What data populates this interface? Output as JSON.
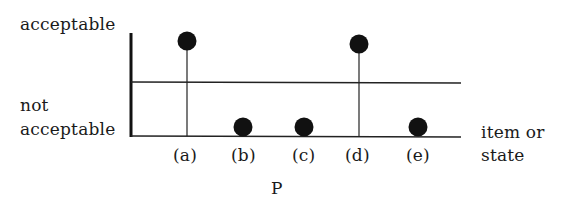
{
  "diagram": {
    "y_labels": {
      "top": "acceptable",
      "bottom_line1": "not",
      "bottom_line2": "acceptable"
    },
    "x_axis_label_line1": "item or",
    "x_axis_label_line2": "state",
    "caption": "P",
    "items": [
      {
        "label": "(a)",
        "state": "acceptable"
      },
      {
        "label": "(b)",
        "state": "not acceptable"
      },
      {
        "label": "(c)",
        "state": "not acceptable"
      },
      {
        "label": "(d)",
        "state": "acceptable"
      },
      {
        "label": "(e)",
        "state": "not acceptable"
      }
    ],
    "colors": {
      "ink": "#111111",
      "background": "#ffffff"
    }
  }
}
